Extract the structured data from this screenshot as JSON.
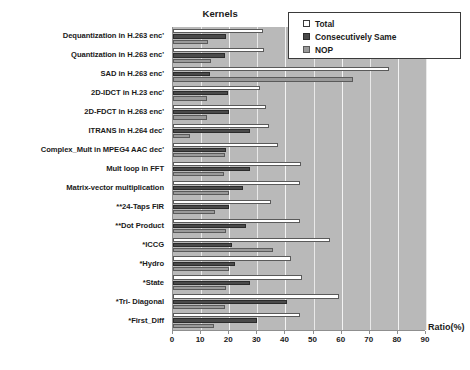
{
  "chart_data": {
    "type": "bar",
    "orientation": "horizontal",
    "title": "",
    "xlabel": "Ratio(%)",
    "ylabel": "Kernels",
    "xlim": [
      0,
      90
    ],
    "xticks": [
      0,
      10,
      20,
      30,
      40,
      50,
      60,
      70,
      80,
      90
    ],
    "grid": true,
    "legend_position": "top-right",
    "categories": [
      "Dequantization in H.263 enc'",
      "Quantization in H.263 enc'",
      "SAD in H.263 enc'",
      "2D-IDCT in H.23 enc'",
      "2D-FDCT in H.263 enc'",
      "ITRANS  in H.264 dec'",
      "Complex_Mult  in MPEG4 AAC dec'",
      "Mult loop in FFT",
      "Matrix-vector multiplication",
      "**24-Taps FIR",
      "**Dot Product",
      "*ICCG",
      "*Hydro",
      "*State",
      "*Tri- Diagonal",
      "*First_Diff"
    ],
    "series": [
      {
        "name": "Total",
        "color": "#ffffff",
        "values": [
          32,
          32.5,
          77,
          31,
          33,
          34,
          37.5,
          45.5,
          45,
          35,
          45,
          56,
          42,
          46,
          59,
          45
        ]
      },
      {
        "name": "Consecutively Same",
        "color": "#4a4a4a",
        "values": [
          19,
          18.5,
          13,
          19.5,
          20,
          27.5,
          19,
          27.5,
          25,
          20,
          26,
          21,
          22,
          27.5,
          40.5,
          30
        ]
      },
      {
        "name": "NOP",
        "color": "#9a9a9a",
        "values": [
          12.5,
          13.5,
          64,
          12,
          12,
          6,
          18.5,
          18,
          20,
          15,
          19,
          35.5,
          20,
          19,
          18.5,
          14.5
        ]
      }
    ]
  },
  "legend": {
    "items": [
      {
        "label": "Total",
        "swatch": "total"
      },
      {
        "label": "Consecutively Same",
        "swatch": "cons"
      },
      {
        "label": "NOP",
        "swatch": "nop"
      }
    ]
  }
}
